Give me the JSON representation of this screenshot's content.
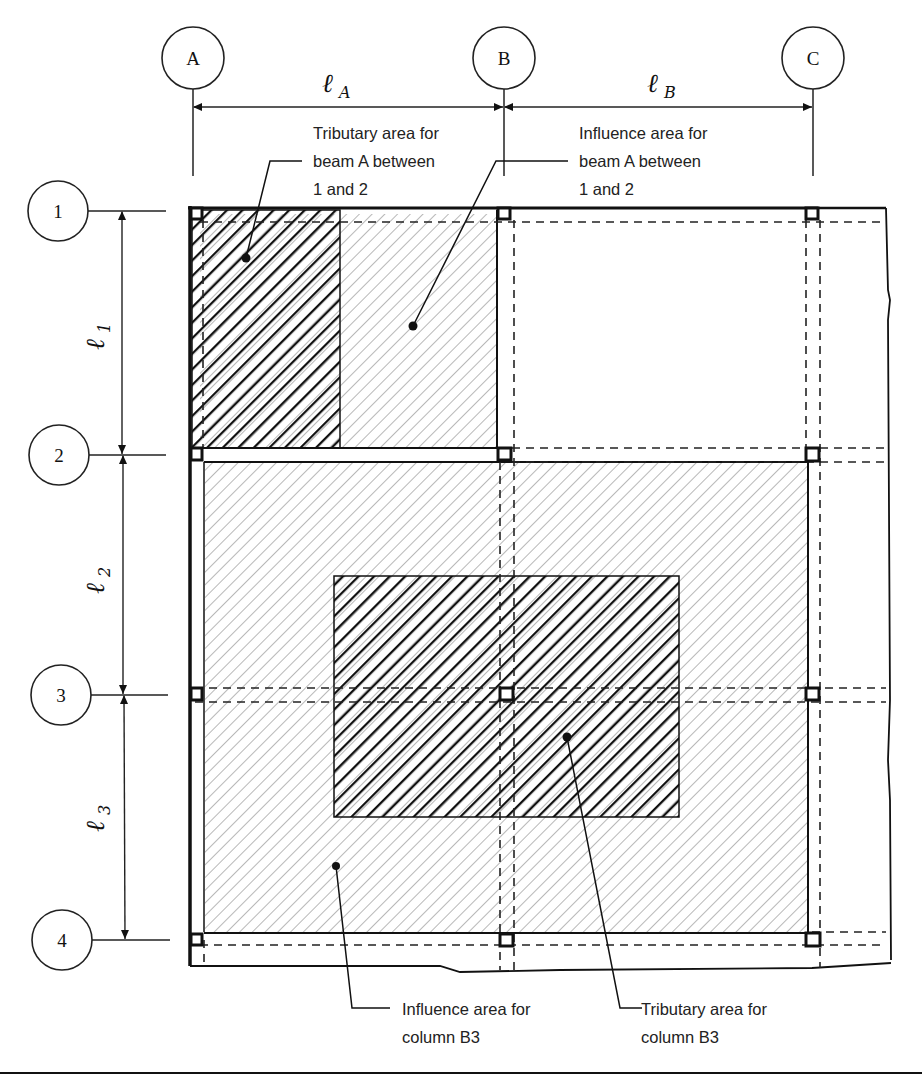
{
  "figure": {
    "colors": {
      "line": "#111111",
      "light_hatch": "#b8b8b8",
      "dark_hatch": "#111111",
      "background": "#ffffff"
    }
  },
  "grid": {
    "columns": [
      {
        "label": "A"
      },
      {
        "label": "B"
      },
      {
        "label": "C"
      }
    ],
    "rows": [
      {
        "label": "1"
      },
      {
        "label": "2"
      },
      {
        "label": "3"
      },
      {
        "label": "4"
      }
    ]
  },
  "dimensions": {
    "horizontal": [
      {
        "symbol": "ℓ",
        "subscript": "A"
      },
      {
        "symbol": "ℓ",
        "subscript": "B"
      }
    ],
    "vertical": [
      {
        "symbol": "ℓ",
        "subscript": "1"
      },
      {
        "symbol": "ℓ",
        "subscript": "2"
      },
      {
        "symbol": "ℓ",
        "subscript": "3"
      }
    ]
  },
  "annotations": {
    "tributary_beam": {
      "line1": "Tributary area for",
      "line2": "beam A between",
      "line3": "1 and 2"
    },
    "influence_beam": {
      "line1": "Influence area for",
      "line2": "beam A between",
      "line3": "1 and 2"
    },
    "influence_column": {
      "line1": "Influence area for",
      "line2": "column B3"
    },
    "tributary_column": {
      "line1": "Tributary area for",
      "line2": "column B3"
    }
  }
}
